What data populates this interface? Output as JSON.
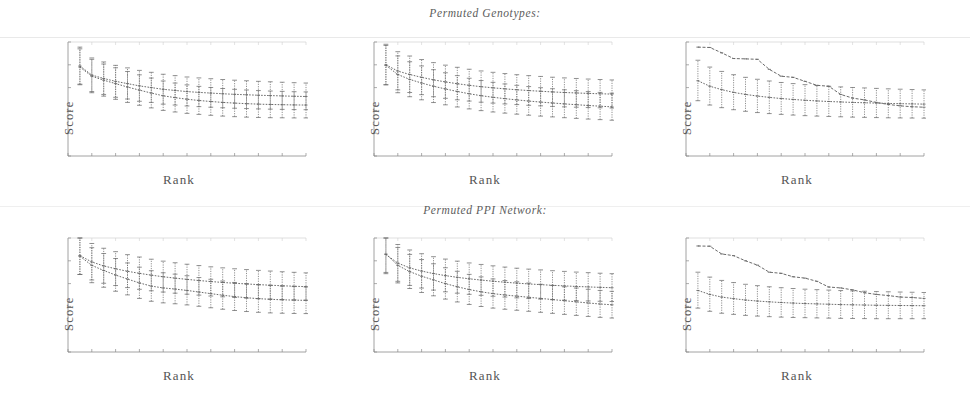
{
  "figure": {
    "background": "#ffffff",
    "ink_color": "#6b6b6b",
    "axis_color": "#8a8a8a",
    "sections": [
      {
        "id": "genotypes",
        "title": "Permuted Genotypes:"
      },
      {
        "id": "ppi",
        "title": "Permuted PPI Network:"
      }
    ]
  },
  "chart_data": [
    {
      "id": "panel-top-left",
      "type": "line",
      "title": "",
      "xlabel": "Rank",
      "ylabel": "Score",
      "xlim": [
        0,
        20
      ],
      "ylim": [
        0,
        1
      ],
      "xticks": [
        0,
        2,
        4,
        6,
        8,
        10,
        12,
        14,
        16,
        18,
        20
      ],
      "yticks": [
        0,
        0.2,
        0.4,
        0.6,
        0.8,
        1.0
      ],
      "tick_labels_shown": false,
      "grid": false,
      "legend": "none",
      "x": [
        1,
        2,
        3,
        4,
        5,
        6,
        7,
        8,
        9,
        10,
        11,
        12,
        13,
        14,
        15,
        16,
        17,
        18,
        19,
        20
      ],
      "series": [
        {
          "name": "observed",
          "style": "dotted-with-errorbars",
          "values": [
            0.79,
            0.71,
            0.68,
            0.655,
            0.635,
            0.615,
            0.6,
            0.585,
            0.575,
            0.565,
            0.558,
            0.552,
            0.546,
            0.541,
            0.537,
            0.533,
            0.53,
            0.527,
            0.524,
            0.522
          ],
          "err_low": [
            0.16,
            0.145,
            0.14,
            0.14,
            0.135,
            0.135,
            0.13,
            0.13,
            0.128,
            0.126,
            0.125,
            0.124,
            0.123,
            0.122,
            0.121,
            0.12,
            0.119,
            0.118,
            0.117,
            0.116
          ],
          "err_high": [
            0.165,
            0.15,
            0.145,
            0.14,
            0.138,
            0.136,
            0.134,
            0.132,
            0.13,
            0.128,
            0.127,
            0.126,
            0.125,
            0.124,
            0.123,
            0.122,
            0.121,
            0.12,
            0.119,
            0.118
          ]
        },
        {
          "name": "permuted",
          "style": "dotted-with-errorbars",
          "values": [
            0.78,
            0.7,
            0.665,
            0.635,
            0.605,
            0.578,
            0.552,
            0.528,
            0.512,
            0.498,
            0.487,
            0.478,
            0.47,
            0.464,
            0.459,
            0.455,
            0.452,
            0.45,
            0.448,
            0.447
          ],
          "err_low": [
            0.155,
            0.145,
            0.14,
            0.138,
            0.135,
            0.133,
            0.13,
            0.128,
            0.126,
            0.124,
            0.122,
            0.121,
            0.12,
            0.119,
            0.118,
            0.117,
            0.116,
            0.115,
            0.114,
            0.113
          ],
          "err_high": [
            0.16,
            0.148,
            0.142,
            0.139,
            0.136,
            0.134,
            0.132,
            0.13,
            0.128,
            0.126,
            0.124,
            0.123,
            0.122,
            0.121,
            0.12,
            0.119,
            0.118,
            0.117,
            0.116,
            0.115
          ]
        }
      ]
    },
    {
      "id": "panel-top-middle",
      "type": "line",
      "title": "",
      "xlabel": "Rank",
      "ylabel": "Score",
      "xlim": [
        0,
        20
      ],
      "ylim": [
        0,
        1
      ],
      "xticks": [
        0,
        2,
        4,
        6,
        8,
        10,
        12,
        14,
        16,
        18,
        20
      ],
      "yticks": [
        0,
        0.2,
        0.4,
        0.6,
        0.8,
        1.0
      ],
      "tick_labels_shown": false,
      "grid": false,
      "legend": "none",
      "x": [
        1,
        2,
        3,
        4,
        5,
        6,
        7,
        8,
        9,
        10,
        11,
        12,
        13,
        14,
        15,
        16,
        17,
        18,
        19,
        20
      ],
      "series": [
        {
          "name": "observed",
          "style": "dotted-with-errorbars",
          "values": [
            0.8,
            0.745,
            0.715,
            0.69,
            0.668,
            0.65,
            0.634,
            0.62,
            0.608,
            0.598,
            0.589,
            0.581,
            0.574,
            0.568,
            0.562,
            0.557,
            0.553,
            0.549,
            0.546,
            0.543
          ],
          "err_low": [
            0.175,
            0.165,
            0.158,
            0.152,
            0.148,
            0.144,
            0.141,
            0.138,
            0.136,
            0.134,
            0.132,
            0.13,
            0.129,
            0.128,
            0.127,
            0.126,
            0.125,
            0.124,
            0.123,
            0.122
          ],
          "err_high": [
            0.18,
            0.17,
            0.162,
            0.156,
            0.151,
            0.147,
            0.144,
            0.141,
            0.138,
            0.136,
            0.134,
            0.132,
            0.131,
            0.13,
            0.129,
            0.128,
            0.127,
            0.126,
            0.125,
            0.124
          ]
        },
        {
          "name": "permuted",
          "style": "dotted-with-errorbars",
          "values": [
            0.795,
            0.715,
            0.672,
            0.64,
            0.612,
            0.588,
            0.566,
            0.546,
            0.529,
            0.515,
            0.503,
            0.492,
            0.482,
            0.473,
            0.465,
            0.457,
            0.45,
            0.443,
            0.437,
            0.431
          ],
          "err_low": [
            0.17,
            0.16,
            0.152,
            0.147,
            0.143,
            0.139,
            0.136,
            0.133,
            0.131,
            0.129,
            0.127,
            0.125,
            0.124,
            0.123,
            0.122,
            0.121,
            0.12,
            0.119,
            0.118,
            0.117
          ],
          "err_high": [
            0.175,
            0.163,
            0.155,
            0.15,
            0.145,
            0.142,
            0.139,
            0.136,
            0.133,
            0.131,
            0.129,
            0.128,
            0.127,
            0.126,
            0.125,
            0.124,
            0.123,
            0.122,
            0.121,
            0.12
          ]
        }
      ]
    },
    {
      "id": "panel-top-right",
      "type": "line",
      "title": "",
      "xlabel": "Rank",
      "ylabel": "Score",
      "xlim": [
        0,
        20
      ],
      "ylim": [
        0,
        1
      ],
      "xticks": [
        0,
        2,
        4,
        6,
        8,
        10,
        12,
        14,
        16,
        18,
        20
      ],
      "yticks": [
        0,
        0.2,
        0.4,
        0.6,
        0.8,
        1.0
      ],
      "tick_labels_shown": false,
      "grid": false,
      "legend": "none",
      "x": [
        1,
        2,
        3,
        4,
        5,
        6,
        7,
        8,
        9,
        10,
        11,
        12,
        13,
        14,
        15,
        16,
        17,
        18,
        19,
        20
      ],
      "series": [
        {
          "name": "observed",
          "style": "dashed-no-errorbars",
          "values": [
            0.955,
            0.952,
            0.905,
            0.855,
            0.852,
            0.848,
            0.76,
            0.7,
            0.69,
            0.655,
            0.62,
            0.612,
            0.54,
            0.508,
            0.492,
            0.47,
            0.452,
            0.44,
            0.432,
            0.428
          ],
          "err_low": null,
          "err_high": null
        },
        {
          "name": "permuted",
          "style": "dotted-with-errorbars",
          "values": [
            0.66,
            0.612,
            0.582,
            0.558,
            0.54,
            0.526,
            0.514,
            0.504,
            0.496,
            0.489,
            0.483,
            0.478,
            0.474,
            0.47,
            0.467,
            0.464,
            0.461,
            0.459,
            0.457,
            0.455
          ],
          "err_low": [
            0.175,
            0.165,
            0.158,
            0.152,
            0.148,
            0.145,
            0.142,
            0.139,
            0.137,
            0.135,
            0.133,
            0.131,
            0.13,
            0.129,
            0.128,
            0.127,
            0.126,
            0.125,
            0.124,
            0.123
          ],
          "err_high": [
            0.18,
            0.168,
            0.16,
            0.155,
            0.15,
            0.147,
            0.144,
            0.141,
            0.139,
            0.137,
            0.135,
            0.133,
            0.132,
            0.131,
            0.13,
            0.129,
            0.128,
            0.127,
            0.126,
            0.125
          ]
        }
      ]
    },
    {
      "id": "panel-bottom-left",
      "type": "line",
      "title": "",
      "xlabel": "Rank",
      "ylabel": "Score",
      "xlim": [
        0,
        20
      ],
      "ylim": [
        0,
        1
      ],
      "xticks": [
        0,
        2,
        4,
        6,
        8,
        10,
        12,
        14,
        16,
        18,
        20
      ],
      "yticks": [
        0,
        0.2,
        0.4,
        0.6,
        0.8,
        1.0
      ],
      "tick_labels_shown": false,
      "grid": false,
      "legend": "none",
      "x": [
        1,
        2,
        3,
        4,
        5,
        6,
        7,
        8,
        9,
        10,
        11,
        12,
        13,
        14,
        15,
        16,
        17,
        18,
        19,
        20
      ],
      "series": [
        {
          "name": "observed",
          "style": "dotted-with-errorbars",
          "values": [
            0.845,
            0.79,
            0.755,
            0.73,
            0.708,
            0.69,
            0.674,
            0.66,
            0.648,
            0.637,
            0.627,
            0.618,
            0.61,
            0.603,
            0.597,
            0.591,
            0.586,
            0.581,
            0.577,
            0.573
          ],
          "err_low": [
            0.165,
            0.158,
            0.152,
            0.147,
            0.143,
            0.14,
            0.137,
            0.134,
            0.132,
            0.13,
            0.128,
            0.127,
            0.126,
            0.125,
            0.124,
            0.123,
            0.122,
            0.121,
            0.12,
            0.119
          ],
          "err_high": [
            0.17,
            0.162,
            0.155,
            0.15,
            0.146,
            0.143,
            0.14,
            0.137,
            0.135,
            0.133,
            0.131,
            0.129,
            0.128,
            0.127,
            0.126,
            0.125,
            0.124,
            0.123,
            0.122,
            0.121
          ]
        },
        {
          "name": "permuted",
          "style": "dotted-with-errorbars",
          "values": [
            0.84,
            0.76,
            0.715,
            0.675,
            0.64,
            0.606,
            0.578,
            0.562,
            0.552,
            0.54,
            0.526,
            0.512,
            0.498,
            0.486,
            0.476,
            0.468,
            0.462,
            0.458,
            0.455,
            0.453
          ],
          "err_low": [
            0.16,
            0.152,
            0.147,
            0.142,
            0.139,
            0.136,
            0.133,
            0.131,
            0.129,
            0.127,
            0.125,
            0.124,
            0.123,
            0.122,
            0.121,
            0.12,
            0.119,
            0.118,
            0.117,
            0.116
          ],
          "err_high": [
            0.165,
            0.155,
            0.149,
            0.145,
            0.141,
            0.138,
            0.135,
            0.133,
            0.131,
            0.129,
            0.127,
            0.126,
            0.125,
            0.124,
            0.123,
            0.122,
            0.121,
            0.12,
            0.119,
            0.118
          ]
        }
      ]
    },
    {
      "id": "panel-bottom-middle",
      "type": "line",
      "title": "",
      "xlabel": "Rank",
      "ylabel": "Score",
      "xlim": [
        0,
        20
      ],
      "ylim": [
        0,
        1
      ],
      "xticks": [
        0,
        2,
        4,
        6,
        8,
        10,
        12,
        14,
        16,
        18,
        20
      ],
      "yticks": [
        0,
        0.2,
        0.4,
        0.6,
        0.8,
        1.0
      ],
      "tick_labels_shown": false,
      "grid": false,
      "legend": "none",
      "x": [
        1,
        2,
        3,
        4,
        5,
        6,
        7,
        8,
        9,
        10,
        11,
        12,
        13,
        14,
        15,
        16,
        17,
        18,
        19,
        20
      ],
      "series": [
        {
          "name": "observed",
          "style": "dotted-with-errorbars",
          "values": [
            0.855,
            0.78,
            0.738,
            0.71,
            0.688,
            0.67,
            0.655,
            0.642,
            0.631,
            0.621,
            0.612,
            0.604,
            0.597,
            0.591,
            0.585,
            0.58,
            0.575,
            0.571,
            0.567,
            0.564
          ],
          "err_low": [
            0.168,
            0.16,
            0.154,
            0.149,
            0.145,
            0.142,
            0.139,
            0.136,
            0.134,
            0.132,
            0.13,
            0.129,
            0.128,
            0.127,
            0.126,
            0.125,
            0.124,
            0.123,
            0.122,
            0.121
          ],
          "err_high": [
            0.172,
            0.163,
            0.157,
            0.152,
            0.148,
            0.145,
            0.142,
            0.139,
            0.137,
            0.135,
            0.133,
            0.131,
            0.13,
            0.129,
            0.128,
            0.127,
            0.126,
            0.125,
            0.124,
            0.123
          ]
        },
        {
          "name": "permuted",
          "style": "dotted-with-errorbars",
          "values": [
            0.86,
            0.76,
            0.705,
            0.665,
            0.632,
            0.6,
            0.572,
            0.548,
            0.528,
            0.512,
            0.5,
            0.49,
            0.48,
            0.47,
            0.46,
            0.45,
            0.44,
            0.43,
            0.421,
            0.414
          ],
          "err_low": [
            0.162,
            0.154,
            0.148,
            0.143,
            0.139,
            0.136,
            0.133,
            0.131,
            0.129,
            0.127,
            0.125,
            0.124,
            0.123,
            0.122,
            0.121,
            0.12,
            0.119,
            0.118,
            0.117,
            0.116
          ],
          "err_high": [
            0.166,
            0.157,
            0.151,
            0.146,
            0.142,
            0.139,
            0.136,
            0.133,
            0.131,
            0.129,
            0.127,
            0.126,
            0.125,
            0.124,
            0.123,
            0.122,
            0.121,
            0.12,
            0.119,
            0.118
          ]
        }
      ]
    },
    {
      "id": "panel-bottom-right",
      "type": "line",
      "title": "",
      "xlabel": "Rank",
      "ylabel": "Score",
      "xlim": [
        0,
        20
      ],
      "ylim": [
        0,
        1
      ],
      "xticks": [
        0,
        2,
        4,
        6,
        8,
        10,
        12,
        14,
        16,
        18,
        20
      ],
      "yticks": [
        0,
        0.2,
        0.4,
        0.6,
        0.8,
        1.0
      ],
      "tick_labels_shown": false,
      "grid": false,
      "legend": "none",
      "x": [
        1,
        2,
        3,
        4,
        5,
        6,
        7,
        8,
        9,
        10,
        11,
        12,
        13,
        14,
        15,
        16,
        17,
        18,
        19,
        20
      ],
      "series": [
        {
          "name": "observed",
          "style": "dashed-no-errorbars",
          "values": [
            0.93,
            0.928,
            0.86,
            0.845,
            0.8,
            0.762,
            0.7,
            0.69,
            0.66,
            0.648,
            0.62,
            0.57,
            0.562,
            0.545,
            0.52,
            0.505,
            0.495,
            0.482,
            0.478,
            0.47
          ],
          "err_low": null,
          "err_high": null
        },
        {
          "name": "permuted",
          "style": "dotted-with-errorbars",
          "values": [
            0.54,
            0.505,
            0.482,
            0.468,
            0.456,
            0.447,
            0.44,
            0.434,
            0.429,
            0.425,
            0.422,
            0.419,
            0.416,
            0.414,
            0.412,
            0.41,
            0.409,
            0.408,
            0.407,
            0.406
          ],
          "err_low": [
            0.155,
            0.148,
            0.142,
            0.138,
            0.135,
            0.132,
            0.13,
            0.128,
            0.126,
            0.124,
            0.123,
            0.122,
            0.121,
            0.12,
            0.119,
            0.118,
            0.117,
            0.116,
            0.115,
            0.114
          ],
          "err_high": [
            0.16,
            0.152,
            0.146,
            0.141,
            0.138,
            0.135,
            0.132,
            0.13,
            0.128,
            0.126,
            0.125,
            0.124,
            0.123,
            0.122,
            0.121,
            0.12,
            0.119,
            0.118,
            0.117,
            0.116
          ]
        }
      ]
    }
  ]
}
